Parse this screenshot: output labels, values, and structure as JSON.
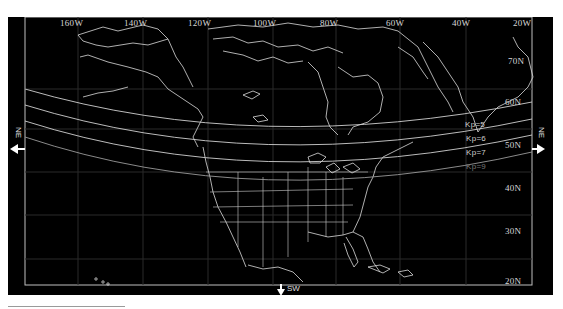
{
  "map": {
    "background": "#000000",
    "line_color": "#dcdcdc",
    "longitude_labels": [
      {
        "text": "160W",
        "x": 60
      },
      {
        "text": "140W",
        "x": 123
      },
      {
        "text": "120W",
        "x": 188
      },
      {
        "text": "100W",
        "x": 252
      },
      {
        "text": "80W",
        "x": 318
      },
      {
        "text": "60W",
        "x": 384
      },
      {
        "text": "40W",
        "x": 450
      },
      {
        "text": "20W",
        "x": 513
      }
    ],
    "latitude_labels": [
      {
        "text": "70N",
        "y": 43
      },
      {
        "text": "60N",
        "y": 84
      },
      {
        "text": "50N",
        "y": 127
      },
      {
        "text": "40N",
        "y": 170
      },
      {
        "text": "30N",
        "y": 213
      },
      {
        "text": "20N",
        "y": 256
      }
    ],
    "kp_lines": [
      {
        "label": "Kp=5",
        "dim": false
      },
      {
        "label": "Kp=6",
        "dim": false
      },
      {
        "label": "Kp=7",
        "dim": false
      },
      {
        "label": "Kp=9",
        "dim": true
      }
    ],
    "directions": {
      "left": "NE",
      "right": "NE",
      "bottom": "SW"
    }
  }
}
